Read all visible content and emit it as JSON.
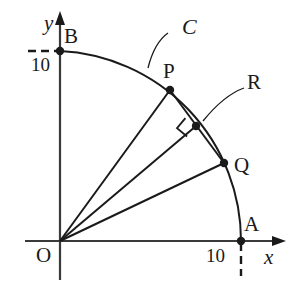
{
  "figure": {
    "type": "geometry-diagram",
    "background_color": "#ffffff",
    "stroke_color": "#1a1a1a"
  },
  "axes": {
    "x_label": "x",
    "y_label": "y",
    "x_tick_label": "10",
    "y_tick_label": "10"
  },
  "points": [
    {
      "name": "O",
      "label": "O",
      "x": 60,
      "y": 241,
      "dot": false
    },
    {
      "name": "B",
      "label": "B",
      "x": 60,
      "y": 51,
      "dot": true
    },
    {
      "name": "P",
      "label": "P",
      "x": 170,
      "y": 90,
      "dot": true
    },
    {
      "name": "R",
      "label": "R",
      "x": 196,
      "y": 126,
      "dot": true
    },
    {
      "name": "Q",
      "label": "Q",
      "x": 224,
      "y": 163,
      "dot": true
    },
    {
      "name": "A",
      "label": "A",
      "x": 241,
      "y": 241,
      "dot": true
    }
  ],
  "curve": {
    "name": "C",
    "label": "C",
    "radius_value": "10",
    "center": "O"
  },
  "labels": {
    "O": "O",
    "A": "A",
    "B": "B",
    "P": "P",
    "Q": "Q",
    "R": "R",
    "C": "C",
    "x": "x",
    "y": "y",
    "tick_x": "10",
    "tick_y": "10"
  }
}
